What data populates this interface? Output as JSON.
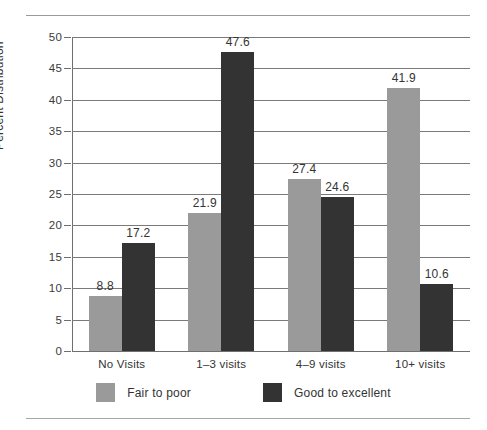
{
  "chart_data": {
    "type": "bar",
    "title": "",
    "xlabel": "",
    "ylabel": "Percent Distribution",
    "categories": [
      "No Visits",
      "1–3 visits",
      "4–9 visits",
      "10+ visits"
    ],
    "series": [
      {
        "name": "Fair to poor",
        "color": "#9a9a9a",
        "values": [
          8.8,
          21.9,
          27.4,
          41.9
        ]
      },
      {
        "name": "Good to excellent",
        "color": "#333333",
        "values": [
          17.2,
          47.6,
          24.6,
          10.6
        ]
      }
    ],
    "ylim": [
      0,
      50
    ],
    "ytick_labels": [
      "0",
      "5",
      "10",
      "15",
      "20",
      "25",
      "30",
      "35",
      "40",
      "45",
      "50"
    ],
    "ytick_values": [
      0,
      5,
      10,
      15,
      20,
      25,
      30,
      35,
      40,
      45,
      50
    ],
    "grid": true,
    "legend_position": "bottom",
    "data_labels": [
      [
        "8.8",
        "17.2"
      ],
      [
        "21.9",
        "47.6"
      ],
      [
        "27.4",
        "24.6"
      ],
      [
        "41.9",
        "10.6"
      ]
    ]
  },
  "colors": {
    "series_light": "#9a9a9a",
    "series_dark": "#333333",
    "gridline": "#7a7a7a",
    "axis": "#6f6f6f",
    "rule": "#9a9a9a",
    "text": "#333333"
  }
}
